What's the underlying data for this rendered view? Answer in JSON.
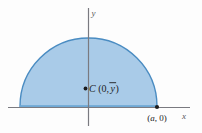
{
  "figure": {
    "background_color": "#fdfdfd"
  },
  "axes": {
    "x_label": "x",
    "y_label": "y",
    "axis_color": "#7a7a80",
    "x_axis": {
      "start_x": 8,
      "end_x": 190,
      "y": 107.5
    },
    "y_axis": {
      "x": 88.5,
      "start_y": 8,
      "end_y": 126
    }
  },
  "region": {
    "shape": "semicircle",
    "fill_color": "#a9cbe8",
    "stroke_color": "#4a8cc2",
    "center_x": 88.5,
    "base_y": 106.5,
    "radius": 68.5,
    "base_strip_color": "#6fa8d4"
  },
  "points": [
    {
      "name": "centroid",
      "dot_x": 85.5,
      "dot_y": 88.5,
      "dot_color": "#1c1c1c",
      "label_prefix": "C",
      "label_open": "(0,",
      "label_var": "y",
      "label_overbar": true,
      "label_close": ")",
      "label_text": "C (0, ȳ)"
    },
    {
      "name": "edge-point",
      "dot_x": 157,
      "dot_y": 107,
      "dot_color": "#1c1c1c",
      "label_open": "(",
      "label_var": "a",
      "label_close": ", 0)",
      "label_text": "(a, 0)"
    }
  ]
}
